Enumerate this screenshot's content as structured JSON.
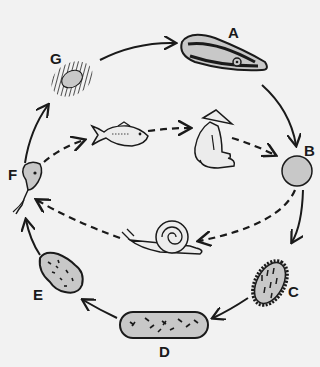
{
  "diagram": {
    "type": "life-cycle",
    "colors": {
      "background": "#f2f2f2",
      "stroke": "#1a1a1a",
      "fill": "#c8c8c8"
    },
    "stages": [
      {
        "id": "A",
        "label": "A",
        "icon": "adult-worm-icon"
      },
      {
        "id": "B",
        "label": "B",
        "icon": "egg-icon"
      },
      {
        "id": "C",
        "label": "C",
        "icon": "miracidium-icon"
      },
      {
        "id": "D",
        "label": "D",
        "icon": "sporocyst-icon"
      },
      {
        "id": "E",
        "label": "E",
        "icon": "redia-icon"
      },
      {
        "id": "F",
        "label": "F",
        "icon": "cercaria-icon"
      },
      {
        "id": "G",
        "label": "G",
        "icon": "metacercaria-icon"
      }
    ],
    "hosts": [
      {
        "name": "human",
        "icon": "human-host-icon"
      },
      {
        "name": "snail",
        "icon": "snail-host-icon"
      },
      {
        "name": "fish",
        "icon": "fish-host-icon"
      }
    ],
    "cycle_order": [
      "A",
      "B",
      "C",
      "D",
      "E",
      "F",
      "G",
      "A"
    ],
    "host_cycle": [
      "human",
      "snail",
      "fish",
      "human"
    ]
  }
}
